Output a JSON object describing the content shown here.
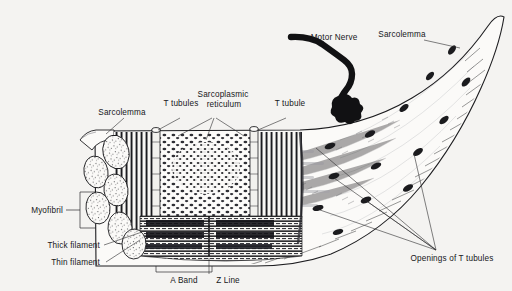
{
  "figure": {
    "background_color": "#f4f3f1",
    "ink_color": "#17171a"
  },
  "labels": {
    "motor_nerve": "Motor Nerve",
    "sarcolemma_right": "Sarcolemma",
    "sarcolemma_left": "Sarcolemma",
    "t_tubules": "T tubules",
    "sarcoplasmic": "Sarcoplasmic",
    "reticulum": "reticulum",
    "t_tubule": "T tubule",
    "myofibril": "Myofibril",
    "thick_filament": "Thick filament",
    "thin_filament": "Thin filament",
    "a_band": "A Band",
    "z_line": "Z Line",
    "openings": "Openings of T tubules"
  },
  "structures": {
    "motor_nerve_color": "#111113",
    "t_tubule_opening_color": "#1b1b1e",
    "myofibril_fill": "#fbfaf8",
    "fiber_fill": "#fbfaf8"
  }
}
